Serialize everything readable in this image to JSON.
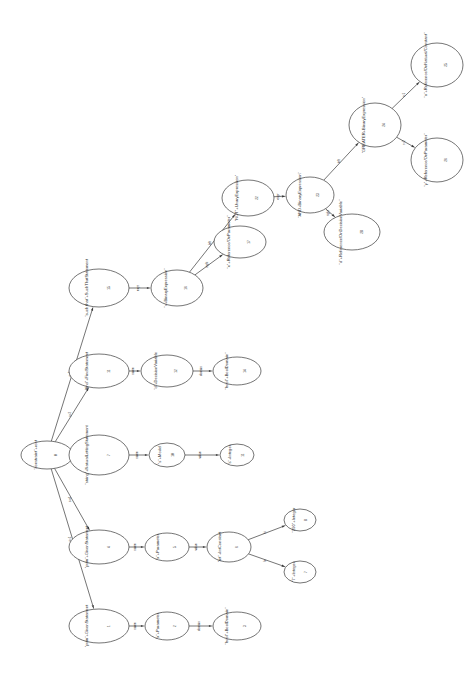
{
  "diagram": {
    "orientation": "rotated-90",
    "background": "#ffffff",
    "stroke_color": "#3a3a3a",
    "text_color": "#2b2b2b",
    "nodes": [
      {
        "key": "n0",
        "label": "\"constraint\"+root",
        "id": "0",
        "cx": 47,
        "cy": 455,
        "rx": 26,
        "ry": 14
      },
      {
        "key": "n1",
        "label": "\"prim\"+GivenStatement",
        "id": "1",
        "cx": 99,
        "cy": 626,
        "rx": 30,
        "ry": 17
      },
      {
        "key": "n2",
        "label": "\"prim\"+GivenStatement",
        "id": "4",
        "cx": 99,
        "cy": 547,
        "rx": 30,
        "ry": 17
      },
      {
        "key": "n3",
        "label": "\"string\"+NaturalLettingStatement",
        "id": "7",
        "cx": 99,
        "cy": 455,
        "rx": 30,
        "ry": 20
      },
      {
        "key": "n4",
        "label": "\"find\"+FindStatement",
        "id": "11",
        "cx": 99,
        "cy": 371,
        "rx": 30,
        "ry": 17
      },
      {
        "key": "n5",
        "label": "\"such that\"+SuchThatStatement",
        "id": "15",
        "cx": 99,
        "cy": 288,
        "rx": 30,
        "ry": 19
      },
      {
        "key": "n6",
        "label": "\"x\"+Parameter",
        "id": "2",
        "cx": 167,
        "cy": 626,
        "rx": 22,
        "ry": 14
      },
      {
        "key": "n7",
        "label": "\"x\"+Parameter",
        "id": "5",
        "cx": 167,
        "cy": 547,
        "rx": 22,
        "ry": 14
      },
      {
        "key": "n8",
        "label": "\"s\"+Model",
        "id": "10",
        "cx": 167,
        "cy": 455,
        "rx": 18,
        "ry": 12
      },
      {
        "key": "n9",
        "label": "\"d\"+DecisionVariable",
        "id": "12",
        "cx": 167,
        "cy": 371,
        "rx": 26,
        "ry": 16
      },
      {
        "key": "n10",
        "label": "\"=+BinaryExpression\"",
        "id": "16",
        "cx": 177,
        "cy": 288,
        "rx": 26,
        "ry": 18
      },
      {
        "key": "n11",
        "label": "\"bool\"+BoolDomain\"",
        "id": "3",
        "cx": 237,
        "cy": 626,
        "rx": 24,
        "ry": 14
      },
      {
        "key": "n12",
        "label": "\"int\"+IntConstant",
        "id": "6",
        "cx": 229,
        "cy": 547,
        "rx": 22,
        "ry": 15
      },
      {
        "key": "n13",
        "label": "\"s\"+Integer",
        "id": "11",
        "cx": 237,
        "cy": 455,
        "rx": 17,
        "ry": 11
      },
      {
        "key": "n14",
        "label": "\"bool\"+BoolDomain\"",
        "id": "14",
        "cx": 237,
        "cy": 371,
        "rx": 24,
        "ry": 14
      },
      {
        "key": "n15",
        "label": "\"x\"+Reference/OnParameter\"",
        "id": "17",
        "cx": 240,
        "cy": 242,
        "rx": 26,
        "ry": 16
      },
      {
        "key": "n16",
        "label": "\"NOT\"+UnaryExpression\"",
        "id": "22",
        "cx": 248,
        "cy": 198,
        "rx": 26,
        "ry": 18
      },
      {
        "key": "n17",
        "label": "\"7\"+Integer",
        "id": "7",
        "cx": 300,
        "cy": 572,
        "rx": 16,
        "ry": 11
      },
      {
        "key": "n18",
        "label": "\"290\"+Integer",
        "id": "8",
        "cx": 300,
        "cy": 520,
        "rx": 16,
        "ry": 11
      },
      {
        "key": "n19",
        "label": "\"AND+BinaryExpression\"",
        "id": "23",
        "cx": 310,
        "cy": 195,
        "rx": 24,
        "ry": 18
      },
      {
        "key": "n20",
        "label": "\"d\"+Reference/OnDecisionVariable\"",
        "id": "28",
        "cx": 352,
        "cy": 232,
        "rx": 28,
        "ry": 18
      },
      {
        "key": "n21",
        "label": "\"GREATER+BinaryExpression\"",
        "id": "24",
        "cx": 375,
        "cy": 125,
        "rx": 26,
        "ry": 22
      },
      {
        "key": "n22",
        "label": "\"x\"+Reference/OnNatural/Constant\"",
        "id": "25",
        "cx": 437,
        "cy": 65,
        "rx": 26,
        "ry": 22
      },
      {
        "key": "n23",
        "label": "\"y\"+Reference/OnParameter\"",
        "id": "26",
        "cx": 437,
        "cy": 160,
        "rx": 26,
        "ry": 22
      }
    ],
    "edges": [
      {
        "from": "n0",
        "to": "n1",
        "label": "s=1"
      },
      {
        "from": "n0",
        "to": "n2",
        "label": "s=4"
      },
      {
        "from": "n0",
        "to": "n3",
        "label": "s=7"
      },
      {
        "from": "n0",
        "to": "n4",
        "label": "s=2"
      },
      {
        "from": "n0",
        "to": "n5",
        "label": "s=3"
      },
      {
        "from": "n1",
        "to": "n6",
        "label": "name"
      },
      {
        "from": "n2",
        "to": "n7",
        "label": "name"
      },
      {
        "from": "n3",
        "to": "n8",
        "label": "name"
      },
      {
        "from": "n4",
        "to": "n9",
        "label": "name"
      },
      {
        "from": "n5",
        "to": "n10",
        "label": "expr"
      },
      {
        "from": "n6",
        "to": "n11",
        "label": "domain"
      },
      {
        "from": "n7",
        "to": "n12",
        "label": "value"
      },
      {
        "from": "n8",
        "to": "n13",
        "label": "value"
      },
      {
        "from": "n9",
        "to": "n14",
        "label": "domain"
      },
      {
        "from": "n10",
        "to": "n15",
        "label": "right"
      },
      {
        "from": "n10",
        "to": "n16",
        "label": "left"
      },
      {
        "from": "n12",
        "to": "n17",
        "label": "lo"
      },
      {
        "from": "n12",
        "to": "n18",
        "label": "hi"
      },
      {
        "from": "n16",
        "to": "n19",
        "label": "expr"
      },
      {
        "from": "n19",
        "to": "n20",
        "label": "right"
      },
      {
        "from": "n19",
        "to": "n21",
        "label": "left"
      },
      {
        "from": "n21",
        "to": "n22",
        "label": "r=1"
      },
      {
        "from": "n21",
        "to": "n23",
        "label": "r=2"
      }
    ]
  }
}
